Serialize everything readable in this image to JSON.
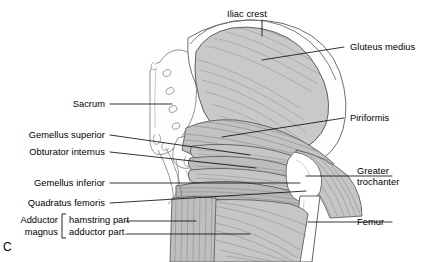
{
  "figure": {
    "panel_id": "C",
    "colors": {
      "muscle_fill": "#c9c9c9",
      "muscle_fill_dark": "#b4b4b4",
      "bone_fill": "#fdfdfd",
      "outline": "#4a4a4a",
      "striation": "#8e8e8e",
      "leader": "#1a1a1a",
      "background": "#ffffff"
    }
  },
  "labels": {
    "iliac_crest": "Iliac crest",
    "gluteus_medius": "Gluteus medius",
    "piriformis": "Piriformis",
    "greater_trochanter_line1": "Greater",
    "greater_trochanter_line2": "trochanter",
    "femur": "Femur",
    "sacrum": "Sacrum",
    "gemellus_superior": "Gemellus superior",
    "obturator_internus": "Obturator internus",
    "gemellus_inferior": "Gemellus inferior",
    "quadratus_femoris": "Quadratus femoris",
    "adductor_line1": "Adductor",
    "adductor_line2": "magnus",
    "hamstring_part": "hamstring part",
    "adductor_part": "adductor part"
  }
}
